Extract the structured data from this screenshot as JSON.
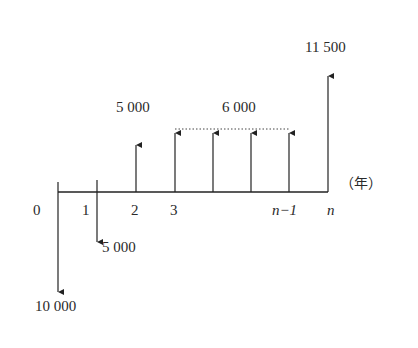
{
  "diagram": {
    "type": "cash-flow-diagram",
    "axis_unit_label": "（年）",
    "ticks": [
      {
        "label": "0",
        "italic": false
      },
      {
        "label": "1",
        "italic": false
      },
      {
        "label": "2",
        "italic": false
      },
      {
        "label": "3",
        "italic": false
      },
      {
        "label": "n−1",
        "italic": true
      },
      {
        "label": "n",
        "italic": true
      }
    ],
    "cash_flows": [
      {
        "period": "0",
        "direction": "out",
        "amount": "10 000"
      },
      {
        "period": "1",
        "direction": "out",
        "amount": "5 000"
      },
      {
        "period": "2",
        "direction": "in",
        "amount": "5 000"
      },
      {
        "period": "3 to n−1",
        "direction": "in",
        "amount": "6 000"
      },
      {
        "period": "n",
        "direction": "in",
        "amount": "11 500"
      }
    ],
    "colors": {
      "line": "#222222",
      "background": "#ffffff"
    }
  }
}
